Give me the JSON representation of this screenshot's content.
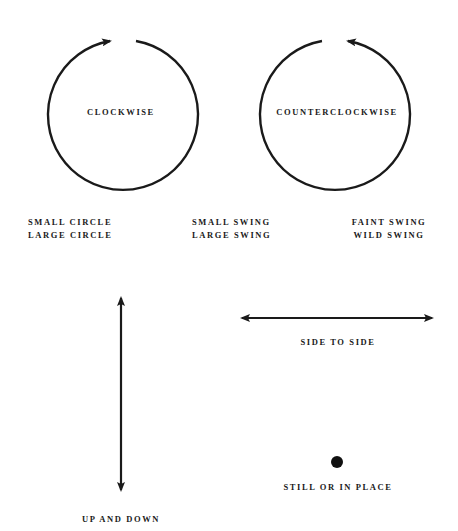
{
  "circles": {
    "clockwise": {
      "label": "CLOCKWISE"
    },
    "counterclockwise": {
      "label": "COUNTERCLOCKWISE"
    }
  },
  "legend": {
    "left": [
      "SMALL CIRCLE",
      "LARGE CIRCLE"
    ],
    "middle": [
      "SMALL SWING",
      "LARGE SWING"
    ],
    "right": [
      "FAINT SWING",
      "WILD SWING"
    ]
  },
  "motions": {
    "vertical": {
      "label": "UP AND DOWN"
    },
    "horizontal": {
      "label": "SIDE TO SIDE"
    },
    "still": {
      "label": "STILL OR IN PLACE"
    }
  },
  "colors": {
    "ink": "#1a1a1a",
    "background": "#ffffff"
  }
}
